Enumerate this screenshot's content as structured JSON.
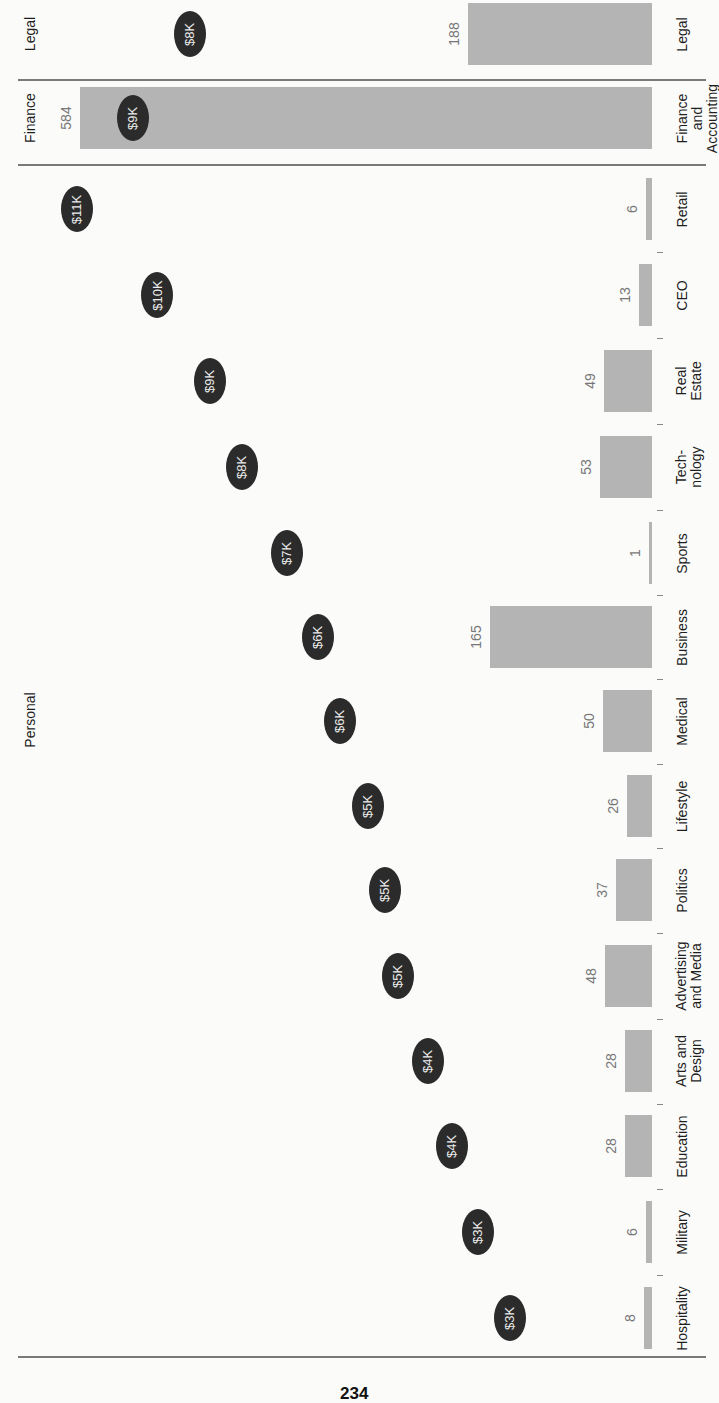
{
  "page": {
    "number": "234",
    "orientation": "rotated-90-ccw"
  },
  "sections": [
    {
      "label": "Legal",
      "y": 34
    },
    {
      "label": "Finance",
      "y": 118
    },
    {
      "label": "Personal",
      "y": 720
    }
  ],
  "chart_data": {
    "type": "bar",
    "title": "",
    "xlabel": "",
    "ylabel": "",
    "categories": [
      "Legal",
      "Finance and Accounting",
      "Retail",
      "CEO",
      "Real Estate",
      "Technology",
      "Sports",
      "Business",
      "Medical",
      "Lifestyle",
      "Politics",
      "Advertising and Media",
      "Arts and Design",
      "Education",
      "Military",
      "Hospitality"
    ],
    "groups": {
      "Legal": [
        "Legal"
      ],
      "Finance": [
        "Finance and Accounting"
      ],
      "Personal": [
        "Retail",
        "CEO",
        "Real Estate",
        "Technology",
        "Sports",
        "Business",
        "Medical",
        "Lifestyle",
        "Politics",
        "Advertising and Media",
        "Arts and Design",
        "Education",
        "Military",
        "Hospitality"
      ]
    },
    "series": [
      {
        "name": "Count",
        "type": "bar",
        "values": [
          188,
          584,
          6,
          13,
          49,
          53,
          1,
          165,
          50,
          26,
          37,
          48,
          28,
          28,
          6,
          8
        ]
      },
      {
        "name": "Amount",
        "type": "bubble",
        "labels": [
          "$8K",
          "$9K",
          "$11K",
          "$10K",
          "$9K",
          "$8K",
          "$7K",
          "$6K",
          "$6K",
          "$5K",
          "$5K",
          "$5K",
          "$4K",
          "$4K",
          "$3K",
          "$3K"
        ],
        "values_k": [
          8,
          9,
          11,
          10,
          9,
          8,
          7,
          6,
          6,
          5,
          5,
          5,
          4,
          4,
          3,
          3
        ]
      }
    ],
    "grid": false,
    "legend": "none"
  },
  "rows": [
    {
      "cat": "Legal",
      "cat_lines": [
        "Legal"
      ],
      "value": "188",
      "bubble": "$8K",
      "y": 34,
      "bar_left": 468,
      "bar_h": 62,
      "bubble_x": 190
    },
    {
      "cat": "Finance and Accounting",
      "cat_lines": [
        "Finance",
        "and",
        "Accounting"
      ],
      "value": "584",
      "bubble": "$9K",
      "y": 118,
      "bar_left": 80,
      "bar_h": 62,
      "bubble_x": 133
    },
    {
      "cat": "Retail",
      "cat_lines": [
        "Retail"
      ],
      "value": "6",
      "bubble": "$11K",
      "y": 209,
      "bar_left": 646,
      "bar_h": 62,
      "bubble_x": 77
    },
    {
      "cat": "CEO",
      "cat_lines": [
        "CEO"
      ],
      "value": "13",
      "bubble": "$10K",
      "y": 295,
      "bar_left": 639,
      "bar_h": 62,
      "bubble_x": 157
    },
    {
      "cat": "Real Estate",
      "cat_lines": [
        "Real",
        "Estate"
      ],
      "value": "49",
      "bubble": "$9K",
      "y": 381,
      "bar_left": 604,
      "bar_h": 62,
      "bubble_x": 210
    },
    {
      "cat": "Technology",
      "cat_lines": [
        "Tech-",
        "nology"
      ],
      "value": "53",
      "bubble": "$8K",
      "y": 467,
      "bar_left": 600,
      "bar_h": 62,
      "bubble_x": 242
    },
    {
      "cat": "Sports",
      "cat_lines": [
        "Sports"
      ],
      "value": "1",
      "bubble": "$7K",
      "y": 553,
      "bar_left": 651,
      "bar_h": 62,
      "bubble_x": 287
    },
    {
      "cat": "Business",
      "cat_lines": [
        "Business"
      ],
      "value": "165",
      "bubble": "$6K",
      "y": 637,
      "bar_left": 490,
      "bar_h": 62,
      "bubble_x": 318
    },
    {
      "cat": "Medical",
      "cat_lines": [
        "Medical"
      ],
      "value": "50",
      "bubble": "$6K",
      "y": 721,
      "bar_left": 603,
      "bar_h": 62,
      "bubble_x": 340
    },
    {
      "cat": "Lifestyle",
      "cat_lines": [
        "Lifestyle"
      ],
      "value": "26",
      "bubble": "$5K",
      "y": 806,
      "bar_left": 627,
      "bar_h": 62,
      "bubble_x": 368
    },
    {
      "cat": "Politics",
      "cat_lines": [
        "Politics"
      ],
      "value": "37",
      "bubble": "$5K",
      "y": 890,
      "bar_left": 616,
      "bar_h": 62,
      "bubble_x": 385
    },
    {
      "cat": "Advertising and Media",
      "cat_lines": [
        "Advertising",
        "and Media"
      ],
      "value": "48",
      "bubble": "$5K",
      "y": 976,
      "bar_left": 605,
      "bar_h": 62,
      "bubble_x": 398
    },
    {
      "cat": "Arts and Design",
      "cat_lines": [
        "Arts and",
        "Design"
      ],
      "value": "28",
      "bubble": "$4K",
      "y": 1061,
      "bar_left": 625,
      "bar_h": 62,
      "bubble_x": 428
    },
    {
      "cat": "Education",
      "cat_lines": [
        "Education"
      ],
      "value": "28",
      "bubble": "$4K",
      "y": 1146,
      "bar_left": 625,
      "bar_h": 62,
      "bubble_x": 452
    },
    {
      "cat": "Military",
      "cat_lines": [
        "Military"
      ],
      "value": "6",
      "bubble": "$3K",
      "y": 1232,
      "bar_left": 646,
      "bar_h": 62,
      "bubble_x": 478
    },
    {
      "cat": "Hospitality",
      "cat_lines": [
        "Hospitality"
      ],
      "value": "8",
      "bubble": "$3K",
      "y": 1318,
      "bar_left": 644,
      "bar_h": 62,
      "bubble_x": 510
    }
  ],
  "separators_y": [
    79,
    164,
    1356
  ]
}
